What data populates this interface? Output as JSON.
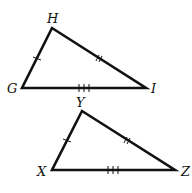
{
  "figure": {
    "triangles": [
      {
        "name": "triangle-GHI",
        "vertices": [
          {
            "label": "H",
            "x": 52,
            "y": 28,
            "lx": 47,
            "ly": 23
          },
          {
            "label": "G",
            "x": 22,
            "y": 88,
            "lx": 7,
            "ly": 93
          },
          {
            "label": "I",
            "x": 146,
            "y": 88,
            "lx": 151,
            "ly": 93
          }
        ],
        "ticks": [
          {
            "side": "GH",
            "count": 1
          },
          {
            "side": "HI",
            "count": 2
          },
          {
            "side": "GI",
            "count": 3
          }
        ]
      },
      {
        "name": "triangle-XYZ",
        "vertices": [
          {
            "label": "Y",
            "x": 82,
            "y": 111,
            "lx": 76,
            "ly": 107
          },
          {
            "label": "X",
            "x": 52,
            "y": 170,
            "lx": 37,
            "ly": 176
          },
          {
            "label": "Z",
            "x": 175,
            "y": 170,
            "lx": 181,
            "ly": 176
          }
        ],
        "ticks": [
          {
            "side": "XY",
            "count": 1
          },
          {
            "side": "YZ",
            "count": 2
          },
          {
            "side": "XZ",
            "count": 3
          }
        ]
      }
    ]
  }
}
